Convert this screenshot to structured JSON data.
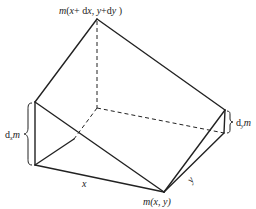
{
  "labels": {
    "top_vertex": "m(x+ dx, y+dy )",
    "top_m": "m",
    "top_args_1": "(",
    "top_x": "x",
    "top_plus_dx": "+ d",
    "top_dx_x": "x",
    "top_comma": ", ",
    "top_y": "y",
    "top_plus_dy": "+d",
    "top_dy_y": "y",
    "top_close": " )",
    "bottom_vertex_m": "m",
    "bottom_vertex_args": "(x, y)",
    "left_dm_d": "d",
    "left_dm_sub": "x",
    "left_dm_m": "m",
    "right_dm_d": "d",
    "right_dm_sub": "y",
    "right_dm_m": "m",
    "edge_x": "x",
    "edge_y": "y"
  },
  "colors": {
    "line": "#222222",
    "background": "#ffffff"
  }
}
